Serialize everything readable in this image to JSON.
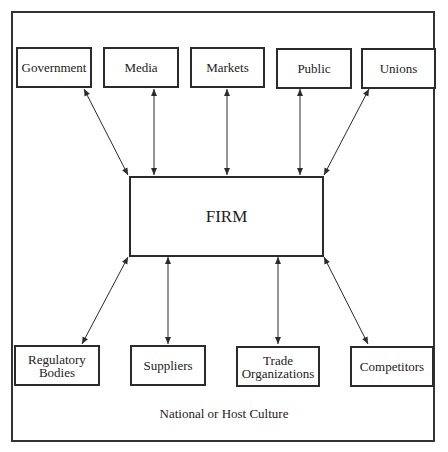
{
  "diagram": {
    "center": {
      "label": "FIRM"
    },
    "top_nodes": [
      {
        "label": "Government"
      },
      {
        "label": "Media"
      },
      {
        "label": "Markets"
      },
      {
        "label": "Public"
      },
      {
        "label": "Unions"
      }
    ],
    "bottom_nodes": [
      {
        "line1": "Regulatory",
        "line2": "Bodies"
      },
      {
        "line1": "Suppliers",
        "line2": ""
      },
      {
        "line1": "Trade",
        "line2": "Organizations"
      },
      {
        "line1": "Competitors",
        "line2": ""
      }
    ],
    "caption": "National or Host Culture",
    "edges": "bidirectional arrows between FIRM and each of the nine surrounding entities",
    "colors": {
      "line": "#2b2b2b",
      "background": "#ffffff"
    }
  }
}
